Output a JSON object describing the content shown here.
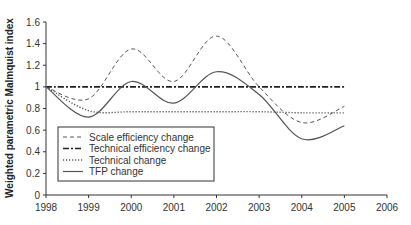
{
  "chart_data": {
    "type": "line",
    "title": "",
    "xlabel": "",
    "ylabel": "Weighted parametric Malmquist index",
    "x": [
      1998,
      1999,
      2000,
      2001,
      2002,
      2003,
      2004,
      2005
    ],
    "xticks": [
      "1998",
      "1999",
      "2000",
      "2001",
      "2002",
      "2003",
      "2004",
      "2005",
      "2006"
    ],
    "yticks": [
      "0",
      "0.2",
      "0.4",
      "0.6",
      "0.8",
      "1",
      "1.2",
      "1.4",
      "1.6"
    ],
    "xlim": [
      1998,
      2006
    ],
    "ylim": [
      0,
      1.6
    ],
    "grid": false,
    "legend_position": "lower left (inside)",
    "series": [
      {
        "name": "Scale efficiency change",
        "style": "dashed",
        "values": [
          1.0,
          0.89,
          1.35,
          1.05,
          1.47,
          1.0,
          0.67,
          0.82
        ]
      },
      {
        "name": "Technical efficiency change",
        "style": "dash-dot",
        "values": [
          1.0,
          1.0,
          1.0,
          1.0,
          1.0,
          1.0,
          1.0,
          1.0
        ]
      },
      {
        "name": "Technical change",
        "style": "dotted",
        "values": [
          1.0,
          0.78,
          0.77,
          0.77,
          0.77,
          0.77,
          0.76,
          0.76
        ]
      },
      {
        "name": "TFP change",
        "style": "solid",
        "values": [
          1.0,
          0.72,
          1.05,
          0.85,
          1.14,
          0.93,
          0.52,
          0.64
        ]
      }
    ]
  },
  "colors": {
    "line": "#555555",
    "axis": "#333333",
    "background": "#ffffff"
  }
}
